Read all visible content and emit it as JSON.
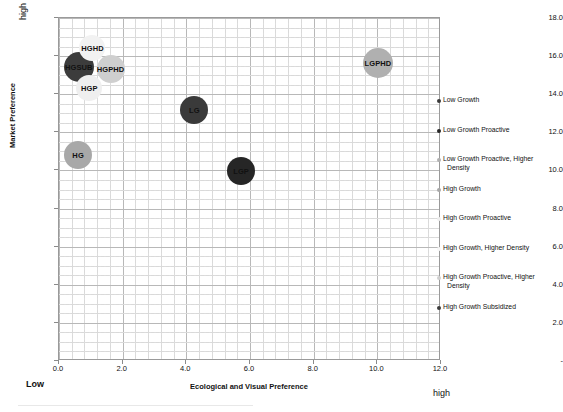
{
  "chart_data": {
    "type": "scatter",
    "title": "",
    "xlabel": "Ecological and Visual Preference",
    "ylabel": "Market Preference",
    "xlim": [
      0.0,
      12.0
    ],
    "ylim": [
      0.0,
      18.0
    ],
    "xticks": [
      "0.0",
      "2.0",
      "4.0",
      "6.0",
      "8.0",
      "10.0",
      "12.0"
    ],
    "xtick_values": [
      0.0,
      2.0,
      4.0,
      6.0,
      8.0,
      10.0,
      12.0
    ],
    "yticks": [
      "-",
      "2.0",
      "4.0",
      "6.0",
      "8.0",
      "10.0",
      "12.0",
      "14.0",
      "16.0",
      "18.0"
    ],
    "ytick_values": [
      0.0,
      2.0,
      4.0,
      6.0,
      8.0,
      10.0,
      12.0,
      14.0,
      16.0,
      18.0
    ],
    "grid": true,
    "legend_position": "right",
    "axis_endpoint_labels": {
      "x_low": "Low",
      "x_high": "high",
      "y_high": "high"
    },
    "points": [
      {
        "label": "HGSUB",
        "x": 0.62,
        "y": 15.45,
        "size": 30,
        "color": "#3c3c3c",
        "series": "High Growth Subsidized"
      },
      {
        "label": "HGPHD",
        "x": 1.62,
        "y": 15.35,
        "size": 28,
        "color": "#cfcfcf",
        "series": "High Growth Proactive, Higher Density"
      },
      {
        "label": "HGHD",
        "x": 1.05,
        "y": 16.45,
        "size": 26,
        "color": "#f2f2f2",
        "series": "High Growth, Higher Density"
      },
      {
        "label": "HGP",
        "x": 0.95,
        "y": 14.35,
        "size": 26,
        "color": "#efefef",
        "series": "High Growth Proactive"
      },
      {
        "label": "HG",
        "x": 0.6,
        "y": 10.8,
        "size": 28,
        "color": "#a8a8a8",
        "series": "High Growth"
      },
      {
        "label": "LG",
        "x": 4.25,
        "y": 13.15,
        "size": 28,
        "color": "#3a3a3a",
        "series": "Low Growth"
      },
      {
        "label": "LGP",
        "x": 5.72,
        "y": 9.95,
        "size": 28,
        "color": "#262626",
        "series": "Low Growth Proactive"
      },
      {
        "label": "LGPHD",
        "x": 10.02,
        "y": 15.65,
        "size": 30,
        "color": "#b0b0b0",
        "series": "Low Growth Proactive, Higher Density"
      }
    ],
    "legend": [
      {
        "label": "Low Growth",
        "label_line2": "",
        "color": "#3a3a3a"
      },
      {
        "label": "Low Growth Proactive",
        "label_line2": "",
        "color": "#262626"
      },
      {
        "label": "Low Growth Proactive, Higher",
        "label_line2": "Density",
        "color": "#b0b0b0"
      },
      {
        "label": "High Growth",
        "label_line2": "",
        "color": "#a8a8a8"
      },
      {
        "label": "High Growth Proactive",
        "label_line2": "",
        "color": "#efefef"
      },
      {
        "label": "High Growth, Higher Density",
        "label_line2": "",
        "color": "#f7f7f7"
      },
      {
        "label": "High Growth Proactive, Higher",
        "label_line2": "Density",
        "color": "#cfcfcf"
      },
      {
        "label": "High Growth Subsidized",
        "label_line2": "",
        "color": "#3c3c3c"
      }
    ]
  }
}
